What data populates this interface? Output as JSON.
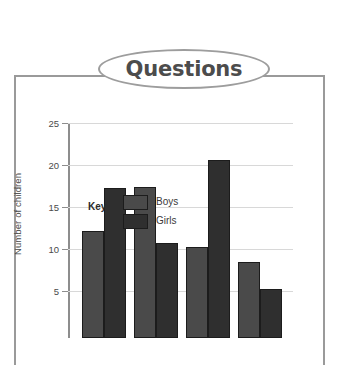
{
  "banner": {
    "title": "Questions"
  },
  "chart_data": {
    "type": "bar",
    "title": "",
    "xlabel": "",
    "ylabel": "Number of children",
    "ylim": [
      0,
      25
    ],
    "yticks": [
      25,
      20,
      15,
      10,
      5
    ],
    "grid": true,
    "legend_title": "Key",
    "legend_position": "inside-top-left",
    "categories": [
      "",
      "",
      "",
      ""
    ],
    "series": [
      {
        "name": "Boys",
        "color": "#4a4a4a",
        "values": [
          12.2,
          17.4,
          10.2,
          8.5
        ]
      },
      {
        "name": "Girls",
        "color": "#2f2f2f",
        "values": [
          17.3,
          10.7,
          20.6,
          5.2
        ]
      }
    ]
  },
  "colors": {
    "boys": "#4a4a4a",
    "girls": "#2f2f2f",
    "gridline": "#d8d8d8",
    "axis": "#8d8d8d",
    "frame": "#9a9a9a",
    "banner_text": "#4c4c4c"
  }
}
